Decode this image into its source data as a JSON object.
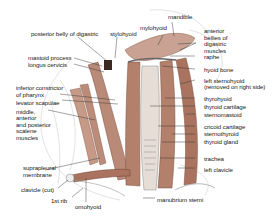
{
  "diagram": {
    "colors": {
      "muscle": "#b98a78",
      "muscle_dark": "#8e5e4e",
      "line": "#333333",
      "bone": "#eeeeee",
      "text": "#222222"
    },
    "labels": {
      "posterior_belly_digastric": "posterior belly of digastric",
      "stylohyoid": "stylohyoid",
      "mylohyoid": "mylohyoid",
      "mandible": "mandible",
      "anterior_bellies_1": "anterior",
      "anterior_bellies_2": "bellies of",
      "anterior_bellies_3": "digastric",
      "anterior_bellies_4": "muscles",
      "raphe": "raphe",
      "hyoid_bone": "hyoid bone",
      "mastoid_process": "mastoid process",
      "longus_cervicis": "longus cervicis",
      "left_sternohyoid_1": "left sternohyoid",
      "left_sternohyoid_2": "(removed on right side)",
      "inferior_constrictor_1": "inferior constrictor",
      "inferior_constrictor_2": "of pharynx",
      "levator_scapulae": "levator scapulae",
      "thyrohyoid": "thyrohyoid",
      "scalene_1": "middle,",
      "scalene_2": "anterior",
      "scalene_3": "and posterior",
      "scalene_4": "scalene",
      "scalene_5": "muscles",
      "thyroid_cartilage": "thyroid cartilage",
      "sternomastoid": "sternomastoid",
      "cricoid_cartilage": "cricoid cartilage",
      "sternothyroid": "sternothyroid",
      "thyroid_gland": "thyroid gland",
      "trachea": "trachea",
      "suprapleural_1": "suprapleural",
      "suprapleural_2": "membrane",
      "left_clavicle": "left clavicle",
      "clavicle_cut": "clavicle (cut)",
      "first_rib": "1st rib",
      "omohyoid": "omohyoid",
      "manubrium_sterni": "manubrium sterni"
    }
  }
}
